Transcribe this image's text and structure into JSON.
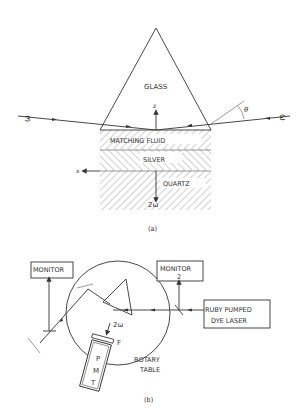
{
  "figure": {
    "panel_a": {
      "caption": "(a)",
      "prism_label": "GLASS",
      "layers": [
        "MATCHING FLUID",
        "SILVER",
        "QUARTZ"
      ],
      "axis_z": "z",
      "axis_x": "x",
      "angle_label": "θ",
      "beam_in_left": "ω",
      "beam_in_right": "ω",
      "beam_out": "2ω"
    },
    "panel_b": {
      "caption": "(b)",
      "monitor_1": "MONITOR",
      "monitor_1_num": "1",
      "monitor_2": "MONITOR",
      "monitor_2_num": "2",
      "laser_line1": "RUBY PUMPED",
      "laser_line2": "DYE LASER",
      "beam_out": "2ω",
      "filter_label": "F",
      "pmt_letters": [
        "P",
        "M",
        "T"
      ],
      "table_line1": "ROTARY",
      "table_line2": "TABLE"
    }
  }
}
